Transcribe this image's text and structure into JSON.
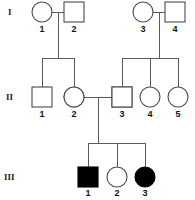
{
  "diagram": {
    "background_color": "#ffffff",
    "line_color": "#5a5a5a",
    "fill_color": "#000000",
    "outline_color": "#4a4a4a"
  },
  "generations": [
    {
      "label": "I",
      "y": 12,
      "label_x": 8,
      "label_y": 15
    },
    {
      "label": "II",
      "y": 97,
      "label_x": 6,
      "label_y": 100
    },
    {
      "label": "III",
      "y": 177,
      "label_x": 4,
      "label_y": 180
    }
  ],
  "individuals": [
    {
      "id": "I-1",
      "number": "1",
      "sex": "female",
      "shape": "circle",
      "fill": "open",
      "cx": 42,
      "cy": 12,
      "num_x": 42,
      "num_y": 32
    },
    {
      "id": "I-2",
      "number": "2",
      "sex": "male",
      "shape": "square",
      "fill": "open",
      "cx": 74,
      "cy": 12,
      "num_x": 74,
      "num_y": 32
    },
    {
      "id": "I-3",
      "number": "3",
      "sex": "female",
      "shape": "circle",
      "fill": "open",
      "cx": 143,
      "cy": 12,
      "num_x": 143,
      "num_y": 32
    },
    {
      "id": "I-4",
      "number": "4",
      "sex": "male",
      "shape": "square",
      "fill": "open",
      "cx": 175,
      "cy": 12,
      "num_x": 175,
      "num_y": 32
    },
    {
      "id": "II-1",
      "number": "1",
      "sex": "male",
      "shape": "square",
      "fill": "open",
      "cx": 42,
      "cy": 97,
      "num_x": 42,
      "num_y": 117
    },
    {
      "id": "II-2",
      "number": "2",
      "sex": "female",
      "shape": "circle",
      "fill": "half-right",
      "cx": 74,
      "cy": 97,
      "num_x": 74,
      "num_y": 117
    },
    {
      "id": "II-3",
      "number": "3",
      "sex": "male",
      "shape": "square",
      "fill": "half-right",
      "cx": 122,
      "cy": 97,
      "num_x": 122,
      "num_y": 117
    },
    {
      "id": "II-4",
      "number": "4",
      "sex": "female",
      "shape": "circle",
      "fill": "open",
      "cx": 150,
      "cy": 97,
      "num_x": 150,
      "num_y": 117
    },
    {
      "id": "II-5",
      "number": "5",
      "sex": "female",
      "shape": "circle",
      "fill": "open",
      "cx": 178,
      "cy": 97,
      "num_x": 178,
      "num_y": 117
    },
    {
      "id": "III-1",
      "number": "1",
      "sex": "male",
      "shape": "square",
      "fill": "filled",
      "cx": 88,
      "cy": 177,
      "num_x": 88,
      "num_y": 196
    },
    {
      "id": "III-2",
      "number": "2",
      "sex": "female",
      "shape": "circle",
      "fill": "open",
      "cx": 117,
      "cy": 177,
      "num_x": 117,
      "num_y": 196
    },
    {
      "id": "III-3",
      "number": "3",
      "sex": "female",
      "shape": "circle",
      "fill": "filled",
      "cx": 145,
      "cy": 177,
      "num_x": 145,
      "num_y": 196
    }
  ],
  "symbol_geometry": {
    "radius": 10,
    "square_size": 20
  },
  "connectors": {
    "mating_lines": [
      {
        "name": "mating-I-1-I-2",
        "x1": 52,
        "y1": 12,
        "x2": 64,
        "y2": 12
      },
      {
        "name": "mating-I-3-I-4",
        "x1": 153,
        "y1": 12,
        "x2": 165,
        "y2": 12
      },
      {
        "name": "mating-II-2-II-3",
        "x1": 84,
        "y1": 97,
        "x2": 112,
        "y2": 97
      }
    ],
    "descent_lines": [
      {
        "name": "descent-family-left",
        "x1": 58,
        "y1": 12,
        "x2": 58,
        "y2": 58
      },
      {
        "name": "descent-family-right",
        "x1": 159,
        "y1": 12,
        "x2": 159,
        "y2": 58
      },
      {
        "name": "descent-family-center",
        "x1": 98,
        "y1": 97,
        "x2": 98,
        "y2": 143
      }
    ],
    "sibship_bars": [
      {
        "name": "sibship-bar-left",
        "x1": 42,
        "y1": 58,
        "x2": 74,
        "y2": 58
      },
      {
        "name": "sibship-bar-right",
        "x1": 122,
        "y1": 58,
        "x2": 178,
        "y2": 58
      },
      {
        "name": "sibship-bar-center",
        "x1": 88,
        "y1": 143,
        "x2": 145,
        "y2": 143
      }
    ],
    "drop_lines": [
      {
        "name": "drop-to-II-1",
        "x1": 42,
        "y1": 58,
        "x2": 42,
        "y2": 87
      },
      {
        "name": "drop-to-II-2",
        "x1": 74,
        "y1": 58,
        "x2": 74,
        "y2": 87
      },
      {
        "name": "drop-to-II-3",
        "x1": 122,
        "y1": 58,
        "x2": 122,
        "y2": 87
      },
      {
        "name": "drop-to-II-4",
        "x1": 150,
        "y1": 58,
        "x2": 150,
        "y2": 87
      },
      {
        "name": "drop-to-II-5",
        "x1": 178,
        "y1": 58,
        "x2": 178,
        "y2": 87
      },
      {
        "name": "drop-to-III-1",
        "x1": 88,
        "y1": 143,
        "x2": 88,
        "y2": 167
      },
      {
        "name": "drop-to-III-2",
        "x1": 117,
        "y1": 143,
        "x2": 117,
        "y2": 167
      },
      {
        "name": "drop-to-III-3",
        "x1": 145,
        "y1": 143,
        "x2": 145,
        "y2": 167
      }
    ]
  }
}
